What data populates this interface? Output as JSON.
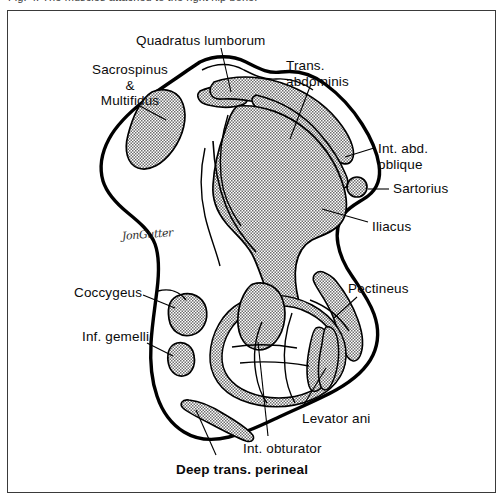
{
  "figure": {
    "type": "anatomical-cross-section-diagram",
    "caption_sliver": "Fig. 4.  The muscles attached to the right hip bone.",
    "artist_signature": "JonGutter",
    "ink_color": "#000000",
    "muscle_fill_color": "#9a9a9a",
    "border_color": "#3a3a3a",
    "background_color": "#ffffff"
  },
  "labels": [
    {
      "id": "quadratus-lumborum",
      "text": "Quadratus lumborum",
      "bold": false,
      "align": "left",
      "x": 136,
      "y": 33
    },
    {
      "id": "sacrospinus",
      "text": "Sacrospinus\n&\nMultifidus",
      "bold": false,
      "align": "center",
      "x": 72,
      "y": 62
    },
    {
      "id": "trans-abdominis",
      "text": "Trans.\nabdominis",
      "bold": false,
      "align": "left",
      "x": 286,
      "y": 58
    },
    {
      "id": "int-abd-oblique",
      "text": "Int. abd.\noblique",
      "bold": false,
      "align": "left",
      "x": 378,
      "y": 141
    },
    {
      "id": "sartorius",
      "text": "Sartorius",
      "bold": false,
      "align": "left",
      "x": 393,
      "y": 184
    },
    {
      "id": "iliacus",
      "text": "Iliacus",
      "bold": false,
      "align": "left",
      "x": 372,
      "y": 221
    },
    {
      "id": "pectineus",
      "text": "Pectineus",
      "bold": false,
      "align": "left",
      "x": 348,
      "y": 283
    },
    {
      "id": "coccygeus",
      "text": "Coccygeus",
      "bold": false,
      "align": "left",
      "x": 74,
      "y": 287
    },
    {
      "id": "inf-gemelli",
      "text": "Inf. gemelli",
      "bold": false,
      "align": "left",
      "x": 82,
      "y": 330
    },
    {
      "id": "levator-ani",
      "text": "Levator ani",
      "bold": false,
      "align": "left",
      "x": 302,
      "y": 413
    },
    {
      "id": "int-obturator",
      "text": "Int. obturator",
      "bold": false,
      "align": "left",
      "x": 243,
      "y": 443
    },
    {
      "id": "deep-trans-perineal",
      "text": "Deep trans. perineal",
      "bold": true,
      "align": "left",
      "x": 176,
      "y": 464
    }
  ]
}
